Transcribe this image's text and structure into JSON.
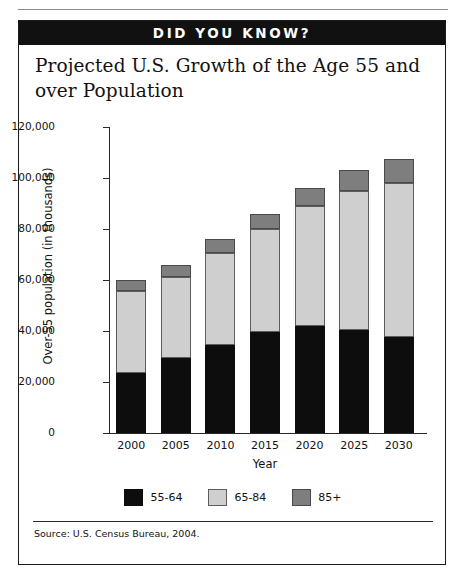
{
  "page": {
    "rule_label": ""
  },
  "callout": {
    "banner": "DID YOU KNOW?",
    "title": "Projected U.S. Growth of the Age 55 and over Population",
    "source": "Source: U.S. Census Bureau, 2004."
  },
  "chart_data": {
    "type": "bar",
    "stacked": true,
    "title": "Projected U.S. Growth of the Age 55 and over Population",
    "xlabel": "Year",
    "ylabel": "Over-55 population (in thousands)",
    "categories": [
      "2000",
      "2005",
      "2010",
      "2015",
      "2020",
      "2025",
      "2030"
    ],
    "ylim": [
      0,
      120000
    ],
    "yticks": [
      0,
      20000,
      40000,
      60000,
      80000,
      100000,
      120000
    ],
    "ytick_labels": [
      "0",
      "20,000",
      "40,000",
      "60,000",
      "80,000",
      "100,000",
      "120,000"
    ],
    "grid": false,
    "legend_position": "bottom",
    "series": [
      {
        "name": "55-64",
        "color": "#0d0d0d",
        "values": [
          23500,
          29500,
          34500,
          39500,
          42000,
          40500,
          37500
        ]
      },
      {
        "name": "65-84",
        "color": "#cfcfcf",
        "values": [
          32000,
          31500,
          36000,
          40500,
          47000,
          54500,
          60500
        ]
      },
      {
        "name": "85+",
        "color": "#7e7e7e",
        "values": [
          4500,
          5000,
          5500,
          6000,
          7000,
          8000,
          9500
        ]
      }
    ],
    "totals": [
      60000,
      66000,
      76000,
      86000,
      96000,
      103000,
      107500
    ]
  }
}
